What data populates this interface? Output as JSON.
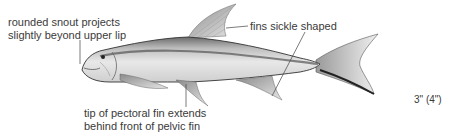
{
  "annotations": {
    "snout": {
      "line1": "rounded snout projects",
      "line2": "slightly beyond upper lip"
    },
    "fins": {
      "text": "fins sickle shaped"
    },
    "pectoral": {
      "line1": "tip of pectoral fin extends",
      "line2": "behind front of pelvic fin"
    }
  },
  "size": {
    "text": "3\" (4\")"
  },
  "colors": {
    "text": "#3a3a3a",
    "leader_line": "#444444",
    "fish_outline": "#333333"
  }
}
